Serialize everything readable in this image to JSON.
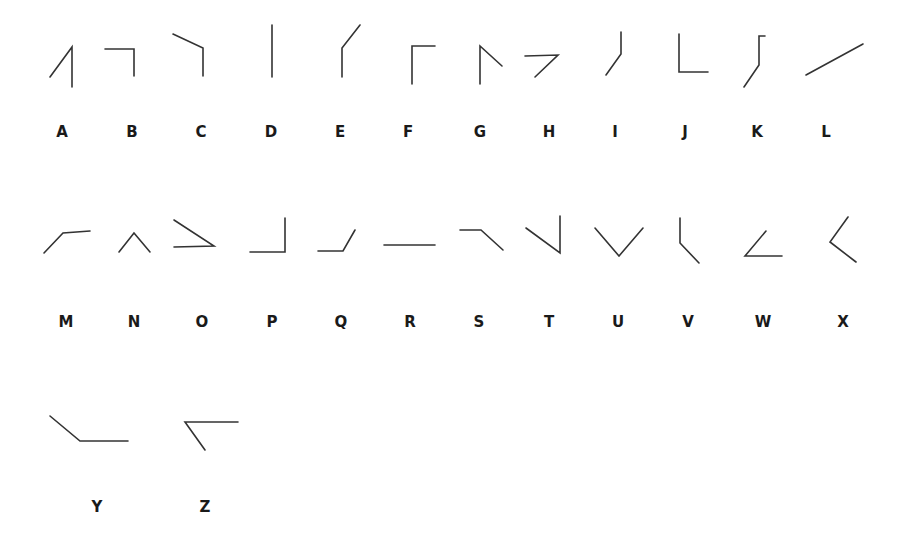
{
  "stroke_color": "#333333",
  "label_color": "#1a1a1a",
  "glyphs": [
    {
      "letter": "A",
      "label_x": 62,
      "label_y": 137,
      "polylines": [
        [
          [
            50,
            77
          ],
          [
            72,
            47
          ],
          [
            72,
            87
          ]
        ]
      ]
    },
    {
      "letter": "B",
      "label_x": 132,
      "label_y": 137,
      "polylines": [
        [
          [
            105,
            49
          ],
          [
            134,
            49
          ],
          [
            134,
            76
          ]
        ]
      ]
    },
    {
      "letter": "C",
      "label_x": 201,
      "label_y": 137,
      "polylines": [
        [
          [
            173,
            34
          ],
          [
            203,
            48
          ],
          [
            203,
            76
          ]
        ]
      ]
    },
    {
      "letter": "D",
      "label_x": 271,
      "label_y": 137,
      "polylines": [
        [
          [
            272,
            25
          ],
          [
            272,
            77
          ]
        ]
      ]
    },
    {
      "letter": "E",
      "label_x": 340,
      "label_y": 137,
      "polylines": [
        [
          [
            360,
            25
          ],
          [
            342,
            48
          ],
          [
            342,
            77
          ]
        ]
      ]
    },
    {
      "letter": "F",
      "label_x": 408,
      "label_y": 137,
      "polylines": [
        [
          [
            435,
            46
          ],
          [
            412,
            46
          ],
          [
            412,
            84
          ]
        ]
      ]
    },
    {
      "letter": "G",
      "label_x": 480,
      "label_y": 137,
      "polylines": [
        [
          [
            502,
            66
          ],
          [
            480,
            46
          ],
          [
            480,
            84
          ]
        ]
      ]
    },
    {
      "letter": "H",
      "label_x": 549,
      "label_y": 137,
      "polylines": [
        [
          [
            525,
            56
          ],
          [
            558,
            55
          ],
          [
            535,
            77
          ]
        ]
      ]
    },
    {
      "letter": "I",
      "label_x": 615,
      "label_y": 137,
      "polylines": [
        [
          [
            621,
            32
          ],
          [
            621,
            54
          ],
          [
            606,
            75
          ]
        ]
      ]
    },
    {
      "letter": "J",
      "label_x": 685,
      "label_y": 137,
      "polylines": [
        [
          [
            679,
            34
          ],
          [
            679,
            72
          ],
          [
            708,
            72
          ]
        ]
      ]
    },
    {
      "letter": "K",
      "label_x": 757,
      "label_y": 137,
      "polylines": [
        [
          [
            765,
            36
          ],
          [
            759,
            36
          ],
          [
            759,
            65
          ],
          [
            744,
            87
          ]
        ]
      ]
    },
    {
      "letter": "L",
      "label_x": 826,
      "label_y": 137,
      "polylines": [
        [
          [
            806,
            75
          ],
          [
            863,
            44
          ]
        ]
      ]
    },
    {
      "letter": "M",
      "label_x": 66,
      "label_y": 327,
      "polylines": [
        [
          [
            44,
            253
          ],
          [
            63,
            233
          ],
          [
            90,
            231
          ]
        ]
      ]
    },
    {
      "letter": "N",
      "label_x": 134,
      "label_y": 327,
      "polylines": [
        [
          [
            119,
            252
          ],
          [
            134,
            233
          ],
          [
            150,
            252
          ]
        ]
      ]
    },
    {
      "letter": "O",
      "label_x": 202,
      "label_y": 327,
      "polylines": [
        [
          [
            174,
            220
          ],
          [
            214,
            246
          ],
          [
            174,
            247
          ]
        ]
      ]
    },
    {
      "letter": "P",
      "label_x": 272,
      "label_y": 327,
      "polylines": [
        [
          [
            250,
            252
          ],
          [
            285,
            252
          ],
          [
            285,
            218
          ]
        ]
      ]
    },
    {
      "letter": "Q",
      "label_x": 341,
      "label_y": 327,
      "polylines": [
        [
          [
            318,
            251
          ],
          [
            343,
            251
          ],
          [
            355,
            230
          ]
        ]
      ]
    },
    {
      "letter": "R",
      "label_x": 410,
      "label_y": 327,
      "polylines": [
        [
          [
            384,
            245
          ],
          [
            435,
            245
          ]
        ]
      ]
    },
    {
      "letter": "S",
      "label_x": 479,
      "label_y": 327,
      "polylines": [
        [
          [
            460,
            230
          ],
          [
            481,
            230
          ],
          [
            503,
            250
          ]
        ]
      ]
    },
    {
      "letter": "T",
      "label_x": 549,
      "label_y": 327,
      "polylines": [
        [
          [
            526,
            228
          ],
          [
            560,
            253
          ],
          [
            560,
            216
          ]
        ]
      ]
    },
    {
      "letter": "U",
      "label_x": 618,
      "label_y": 327,
      "polylines": [
        [
          [
            595,
            228
          ],
          [
            619,
            256
          ],
          [
            643,
            228
          ]
        ]
      ]
    },
    {
      "letter": "V",
      "label_x": 688,
      "label_y": 327,
      "polylines": [
        [
          [
            680,
            218
          ],
          [
            680,
            243
          ],
          [
            699,
            263
          ]
        ]
      ]
    },
    {
      "letter": "W",
      "label_x": 763,
      "label_y": 327,
      "polylines": [
        [
          [
            766,
            231
          ],
          [
            745,
            256
          ],
          [
            782,
            256
          ]
        ]
      ]
    },
    {
      "letter": "X",
      "label_x": 843,
      "label_y": 327,
      "polylines": [
        [
          [
            848,
            217
          ],
          [
            830,
            242
          ],
          [
            856,
            262
          ]
        ]
      ]
    },
    {
      "letter": "Y",
      "label_x": 97,
      "label_y": 512,
      "polylines": [
        [
          [
            50,
            416
          ],
          [
            80,
            441
          ],
          [
            128,
            441
          ]
        ]
      ]
    },
    {
      "letter": "Z",
      "label_x": 205,
      "label_y": 512,
      "polylines": [
        [
          [
            238,
            422
          ],
          [
            185,
            422
          ],
          [
            205,
            450
          ]
        ]
      ]
    }
  ]
}
